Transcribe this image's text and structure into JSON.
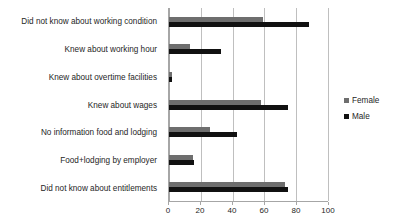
{
  "chart_data": {
    "type": "bar",
    "orientation": "horizontal",
    "title": "",
    "xlabel": "",
    "ylabel": "",
    "xlim": [
      0,
      100
    ],
    "xticks": [
      0,
      20,
      40,
      60,
      80,
      100
    ],
    "xtick_labels": [
      "0",
      "20",
      "40",
      "60",
      "80",
      "100"
    ],
    "grid": "vertical",
    "legend_position": "right",
    "categories": [
      "Did not know about working condition",
      "Knew about working hour",
      "Knew about overtime facilities",
      "Knew about wages",
      "No information food and lodging",
      "Food+lodging by employer",
      "Did not know about entitlements"
    ],
    "series": [
      {
        "name": "Female",
        "color": "#6e6e6e",
        "values": [
          59,
          13,
          2,
          58,
          26,
          15,
          73
        ]
      },
      {
        "name": "Male",
        "color": "#111111",
        "values": [
          88,
          33,
          2,
          75,
          43,
          16,
          75
        ]
      }
    ]
  },
  "legend": {
    "items": [
      {
        "label": "Female",
        "color": "#6e6e6e"
      },
      {
        "label": "Male",
        "color": "#111111"
      }
    ]
  }
}
